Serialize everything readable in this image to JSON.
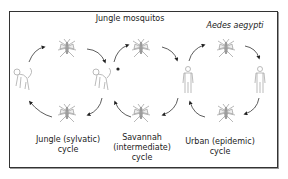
{
  "labels": {
    "jungle_mosquitos": "Jungle mosquitos",
    "aedes": "Aedes aegypti",
    "jungle_cycle_1": "Jungle (sylvatic)",
    "jungle_cycle_2": "cycle",
    "savannah_1": "Savannah",
    "savannah_2": "(intermediate)",
    "savannah_3": "cycle",
    "urban_1": "Urban (epidemic)",
    "urban_2": "cycle"
  },
  "nodes": [
    {
      "type": "monkey",
      "name": "monkey-left"
    },
    {
      "type": "mosquito",
      "name": "mosquito-top-left"
    },
    {
      "type": "monkey",
      "name": "monkey-middle"
    },
    {
      "type": "mosquito",
      "name": "mosquito-top-middle"
    },
    {
      "type": "human",
      "name": "human-left"
    },
    {
      "type": "mosquito",
      "name": "mosquito-top-right"
    },
    {
      "type": "human",
      "name": "human-right"
    },
    {
      "type": "mosquito",
      "name": "mosquito-bottom-left"
    },
    {
      "type": "mosquito",
      "name": "mosquito-bottom-middle"
    },
    {
      "type": "mosquito",
      "name": "mosquito-bottom-right"
    }
  ]
}
